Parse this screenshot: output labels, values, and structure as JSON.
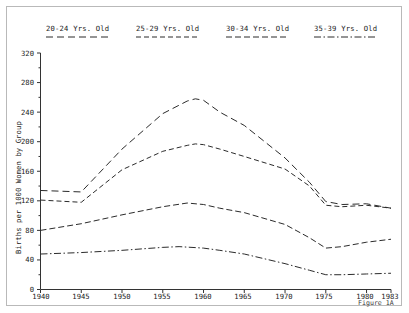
{
  "figure": {
    "caption": "Figure 1A"
  },
  "chart_data": {
    "type": "line",
    "title": "",
    "xlabel": "",
    "ylabel": "Births per 1000 Women by Group",
    "xlim": [
      1940,
      1983
    ],
    "ylim": [
      0,
      320
    ],
    "grid": false,
    "legend_position": "top",
    "y_ticks": [
      0,
      40,
      80,
      120,
      160,
      200,
      240,
      280,
      320
    ],
    "y_tick_labels": [
      "0",
      "40",
      "80",
      "120",
      "160",
      "200",
      "240",
      "280",
      "320"
    ],
    "y_minor_ticks": [
      20,
      60,
      100,
      140,
      180,
      220,
      260,
      300
    ],
    "x_ticks": [
      1940,
      1945,
      1950,
      1955,
      1960,
      1965,
      1970,
      1975,
      1980,
      1983
    ],
    "x_tick_labels": [
      "1940",
      "1945",
      "1950",
      "1955",
      "1960",
      "1965",
      "1970",
      "1975",
      "1980",
      "1983"
    ],
    "series": [
      {
        "name": "20-24 Yrs. Old",
        "dash": "long-dash",
        "color": "#2b2b2b",
        "x": [
          1940,
          1945,
          1950,
          1955,
          1958,
          1959,
          1960,
          1962,
          1965,
          1970,
          1973,
          1975,
          1977,
          1980,
          1983
        ],
        "values": [
          134,
          132,
          190,
          238,
          255,
          258,
          256,
          240,
          222,
          178,
          145,
          119,
          115,
          116,
          110
        ]
      },
      {
        "name": "25-29 Yrs. Old",
        "dash": "dash",
        "color": "#2b2b2b",
        "x": [
          1940,
          1945,
          1950,
          1955,
          1958,
          1959,
          1960,
          1962,
          1965,
          1970,
          1973,
          1975,
          1977,
          1980,
          1983
        ],
        "values": [
          121,
          118,
          162,
          187,
          195,
          197,
          196,
          190,
          180,
          163,
          140,
          114,
          112,
          114,
          110
        ]
      },
      {
        "name": "30-34 Yrs. Old",
        "dash": "dash-long",
        "color": "#2b2b2b",
        "x": [
          1940,
          1945,
          1950,
          1955,
          1958,
          1960,
          1962,
          1965,
          1970,
          1973,
          1975,
          1977,
          1980,
          1983
        ],
        "values": [
          80,
          89,
          101,
          112,
          117,
          115,
          110,
          104,
          88,
          70,
          56,
          58,
          64,
          68
        ]
      },
      {
        "name": "35-39 Yrs. Old",
        "dash": "dash-dot",
        "color": "#2b2b2b",
        "x": [
          1940,
          1945,
          1950,
          1955,
          1957,
          1960,
          1962,
          1965,
          1970,
          1973,
          1975,
          1977,
          1980,
          1983
        ],
        "values": [
          48,
          50,
          53,
          57,
          58,
          56,
          53,
          48,
          35,
          26,
          20,
          20,
          21,
          22
        ]
      }
    ]
  },
  "legend": {
    "items": [
      {
        "label": "20-24 Yrs. Old",
        "dash": "long-dash"
      },
      {
        "label": "25-29 Yrs. Old",
        "dash": "dash"
      },
      {
        "label": "30-34 Yrs. Old",
        "dash": "dash-long"
      },
      {
        "label": "35-39 Yrs. Old",
        "dash": "dash-dot"
      }
    ]
  }
}
